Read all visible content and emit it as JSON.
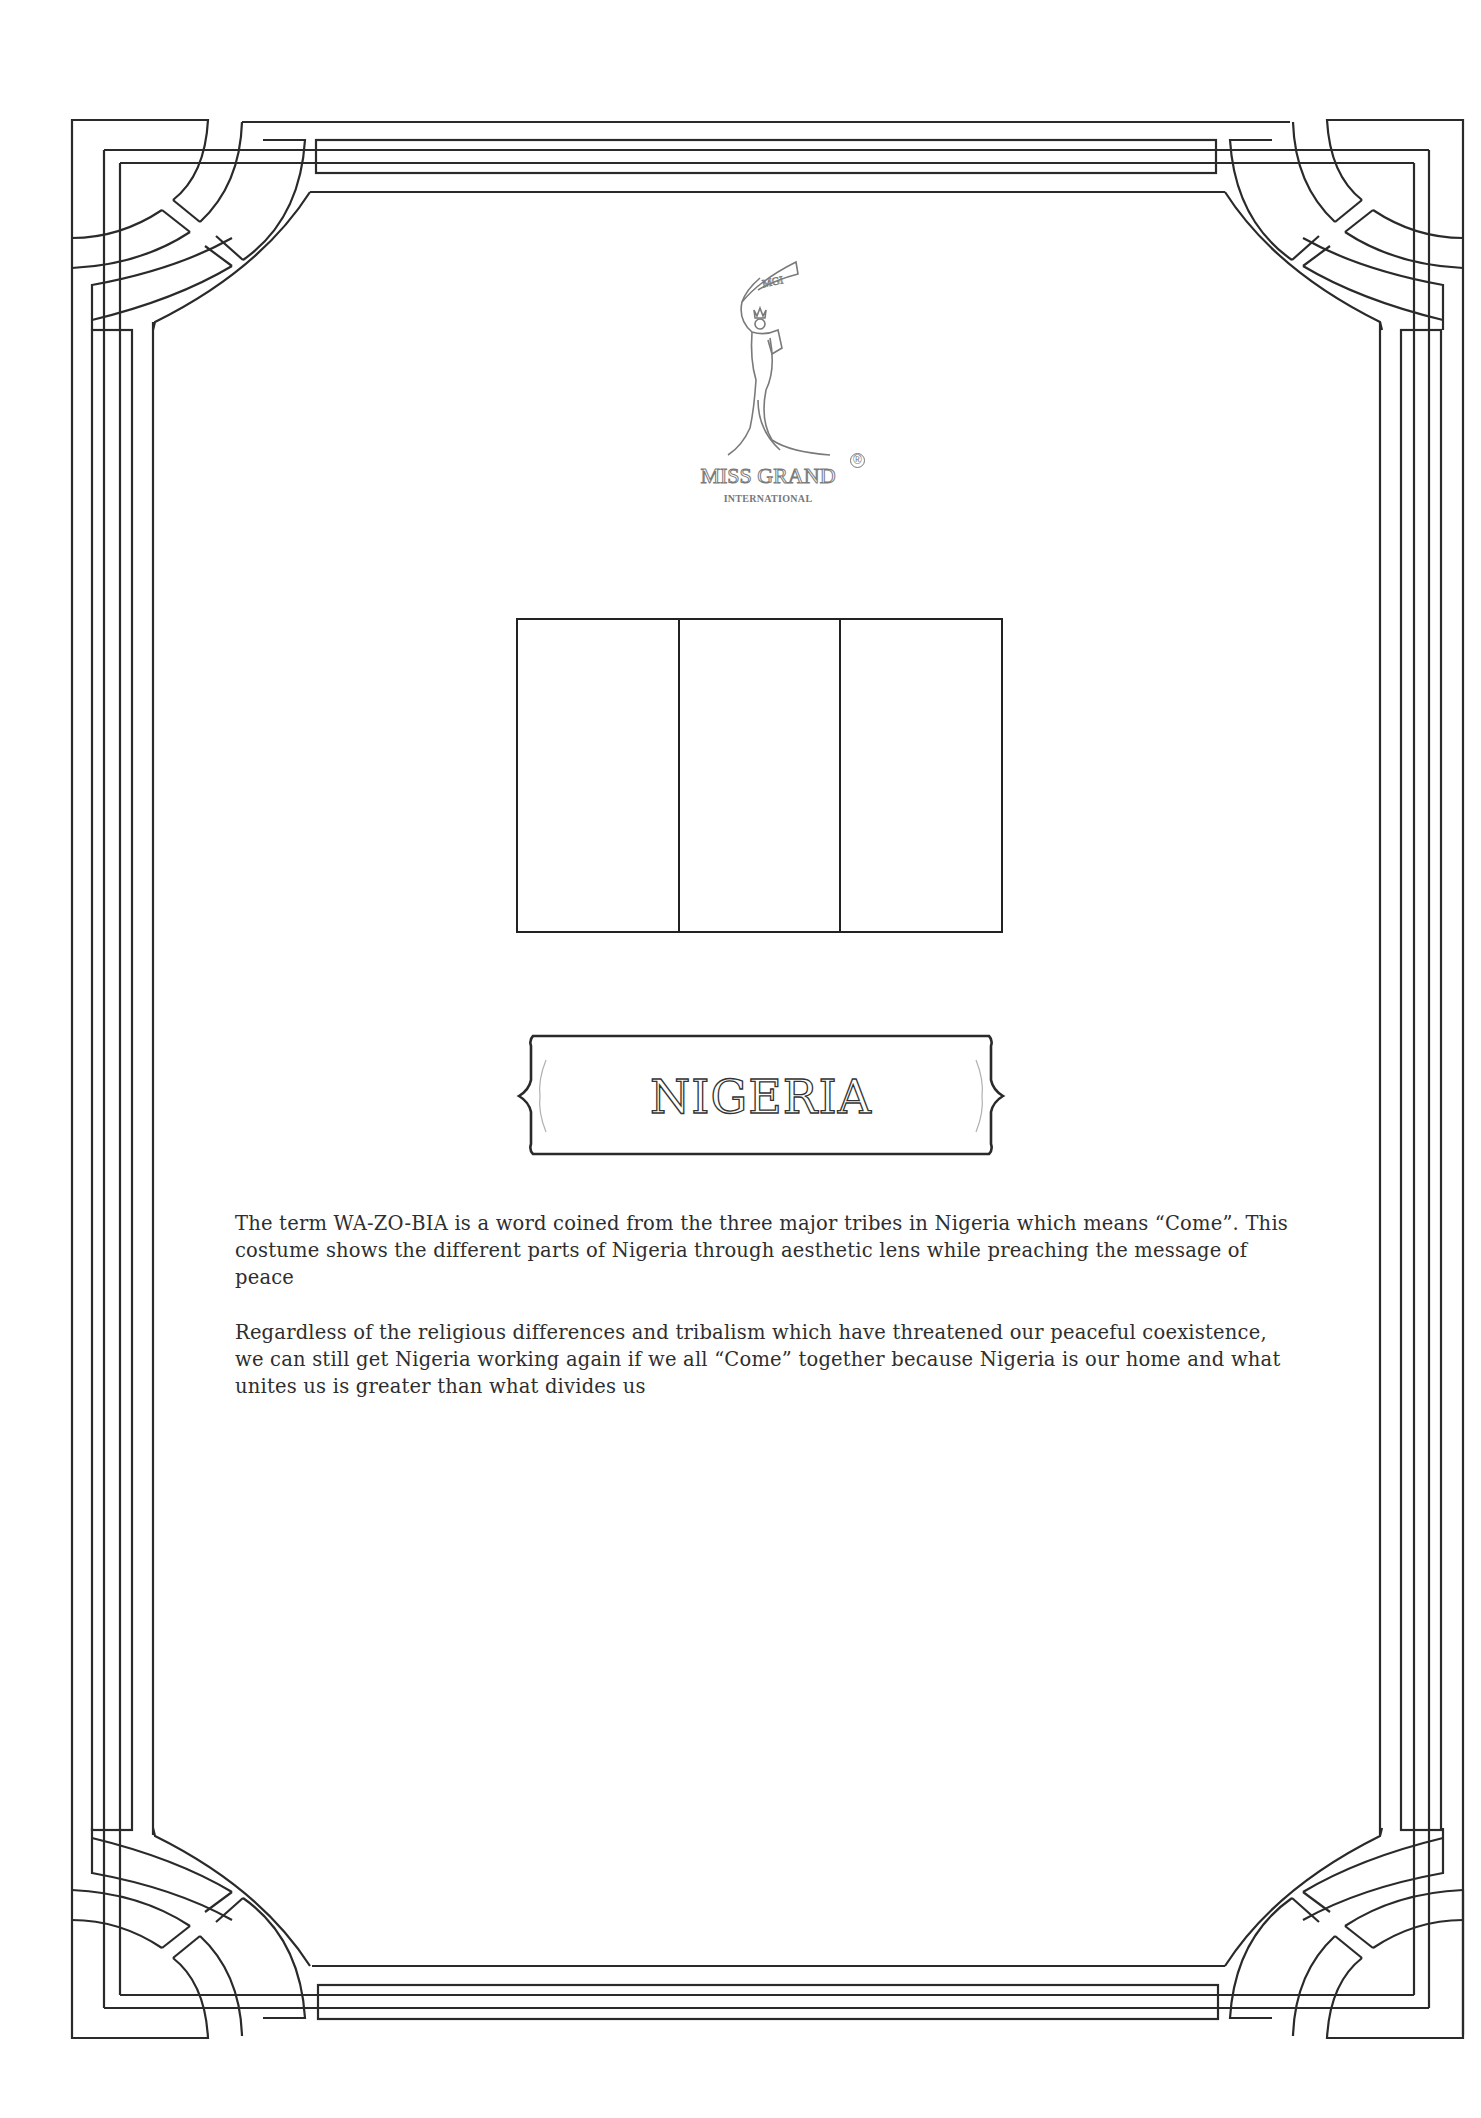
{
  "document": {
    "type": "costume-description-sheet",
    "frame_color": "#2a2a2a"
  },
  "logo": {
    "banner_text": "MGI",
    "title": "MISS GRAND",
    "registered_mark": "®",
    "subtitle": "INTERNATIONAL",
    "icon": "crowned-woman-silhouette-icon"
  },
  "flag": {
    "country": "Nigeria",
    "stripes": 3,
    "orientation": "vertical",
    "style": "outline-coloring"
  },
  "banner": {
    "title": "NIGERIA"
  },
  "description": {
    "paragraphs": [
      "The term WA-ZO-BIA is a word coined from the three major tribes in Nigeria which means “Come”. This costume shows the different parts of Nigeria through aesthetic lens while preaching the message of peace",
      "Regardless of the religious differences and tribalism which have threatened our peaceful coexistence, we can still get Nigeria working again if we all “Come” together because Nigeria is our home and what unites us is greater than what divides us"
    ]
  }
}
